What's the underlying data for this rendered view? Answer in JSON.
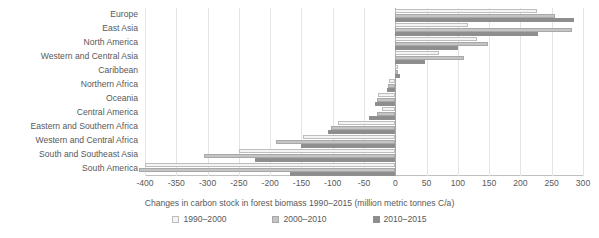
{
  "chart_data": {
    "type": "bar",
    "orientation": "horizontal",
    "title": "",
    "xlabel": "Changes in carbon stock in forest biomass 1990–2015 (million metric tonnes C/a)",
    "ylabel": "",
    "xlim": [
      -400,
      300
    ],
    "xticks": [
      -400,
      -350,
      -300,
      -250,
      -200,
      -150,
      -100,
      -50,
      0,
      50,
      100,
      150,
      200,
      250,
      300
    ],
    "xtick_labels": [
      "-400",
      "-350",
      "-300",
      "-250",
      "-200",
      "-150",
      "-100",
      "-50",
      "0",
      "50",
      "100",
      "150",
      "200",
      "250",
      "300"
    ],
    "grid": true,
    "grid_axis": "x",
    "legend_position": "bottom",
    "categories": [
      "Europe",
      "East Asia",
      "North America",
      "Western and Central Asia",
      "Caribbean",
      "Northern Africa",
      "Oceania",
      "Central America",
      "Eastern and Southern Africa",
      "Western and Central Africa",
      "South and Southeast Asia",
      "South America"
    ],
    "series": [
      {
        "name": "1990–2000",
        "pattern": "light-dotted",
        "color": "#f4f4f4",
        "values": [
          226,
          117,
          130,
          70,
          4,
          -10,
          -28,
          -22,
          -92,
          -148,
          -250,
          -400
        ]
      },
      {
        "name": "2000–2010",
        "pattern": "medium-dotted",
        "color": "#ededed",
        "values": [
          255,
          283,
          148,
          110,
          5,
          -11,
          -30,
          -30,
          -102,
          -190,
          -305,
          -410
        ]
      },
      {
        "name": "2010–2015",
        "pattern": "dark-dotted",
        "color": "#e3e3e3",
        "values": [
          285,
          228,
          100,
          48,
          7,
          -13,
          -32,
          -42,
          -108,
          -150,
          -225,
          -168
        ]
      }
    ]
  },
  "legend": {
    "items": [
      {
        "label": "1990–2000"
      },
      {
        "label": "2000–2010"
      },
      {
        "label": "2010–2015"
      }
    ]
  }
}
